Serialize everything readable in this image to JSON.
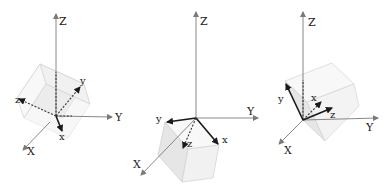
{
  "figure": {
    "panels": [
      {
        "id": "left",
        "world_axes": {
          "Z": "Z",
          "Y": "Y",
          "X": "X"
        },
        "body_axes": {
          "x": "x",
          "y": "y",
          "z": "z"
        }
      },
      {
        "id": "middle",
        "world_axes": {
          "Z": "Z",
          "Y": "Y",
          "X": "X"
        },
        "body_axes": {
          "x": "x",
          "y": "y",
          "z": "z"
        }
      },
      {
        "id": "right",
        "world_axes": {
          "Z": "Z",
          "Y": "Y",
          "X": "X"
        },
        "body_axes": {
          "x": "x",
          "y": "y",
          "z": "z"
        }
      }
    ],
    "colors": {
      "axis": "#7a7a7a",
      "body_axis": "#1a1a1a",
      "cube_face": "#ececec",
      "background": "#ffffff"
    }
  }
}
